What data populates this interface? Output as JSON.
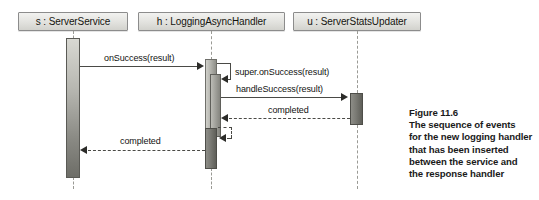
{
  "diagram": {
    "type": "uml-sequence-diagram",
    "lifelines": [
      {
        "id": "s",
        "label": "s : ServerService",
        "box_left": 18,
        "box_width": 110,
        "center_x": 73
      },
      {
        "id": "h",
        "label": "h : LoggingAsyncHandler",
        "box_left": 138,
        "box_width": 147,
        "center_x": 211
      },
      {
        "id": "u",
        "label": "u : ServerStatsUpdater",
        "box_left": 293,
        "box_width": 128,
        "center_x": 357
      }
    ],
    "messages": [
      {
        "label": "onSuccess(result)",
        "from": "s",
        "to": "h",
        "kind": "call",
        "direction": "right"
      },
      {
        "label": "super.onSuccess(result)",
        "from": "h",
        "to": "h",
        "kind": "self",
        "direction": "self"
      },
      {
        "label": "handleSuccess(result)",
        "from": "h",
        "to": "u",
        "kind": "call",
        "direction": "right"
      },
      {
        "label": "completed",
        "from": "u",
        "to": "h",
        "kind": "return",
        "direction": "left"
      },
      {
        "label": "",
        "from": "h",
        "to": "h",
        "kind": "return",
        "direction": "self"
      },
      {
        "label": "completed",
        "from": "h",
        "to": "s",
        "kind": "return",
        "direction": "left"
      }
    ]
  },
  "caption": {
    "lines": [
      "Figure 11.6",
      "The sequence of events",
      "for the new logging handler",
      "that has been inserted",
      "between the service and",
      "the response handler"
    ]
  }
}
